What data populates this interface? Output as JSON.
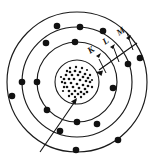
{
  "figure": {
    "type": "bohr-atom-model",
    "background_color": "#ffffff",
    "line_color": "#1a1a1a",
    "electron_color": "#111111",
    "nucleus": {
      "label": "nucleus",
      "center": [
        77,
        82
      ],
      "ring_radius": 22,
      "stipple_radius": 14,
      "nucleon_count": 46
    },
    "shells": [
      {
        "name": "K",
        "label": "K",
        "index": 1,
        "radius": 40,
        "electron_count": 5,
        "electrons": [
          [
            75,
            42
          ],
          [
            37,
            82
          ],
          [
            47,
            110
          ],
          [
            77,
            122
          ],
          [
            113,
            88
          ]
        ]
      },
      {
        "name": "L",
        "label": "L",
        "index": 2,
        "radius": 55,
        "electron_count": 6,
        "electrons": [
          [
            46,
            43
          ],
          [
            80,
            27
          ],
          [
            22,
            82
          ],
          [
            60,
            131
          ],
          [
            97,
            124
          ],
          [
            128,
            64
          ]
        ]
      },
      {
        "name": "M",
        "label": "M",
        "index": 3,
        "radius": 70,
        "electron_count": 6,
        "electrons": [
          [
            57,
            26
          ],
          [
            103,
            31
          ],
          [
            12,
            96
          ],
          [
            76,
            150
          ],
          [
            118,
            140
          ],
          [
            140,
            58
          ]
        ]
      }
    ],
    "annotations": [
      {
        "name": "nucleus-pointer",
        "kind": "arrow",
        "target": "nucleus",
        "from": [
          40,
          152
        ],
        "to": [
          74,
          99
        ]
      },
      {
        "name": "shell-callout-line",
        "kind": "arrow",
        "target": "K-shell",
        "from": [
          134,
          45
        ],
        "to": [
          95,
          73
        ]
      }
    ],
    "shell_labels": [
      {
        "text": "K",
        "x": 90,
        "y": 52,
        "rotation": -35
      },
      {
        "text": "L",
        "x": 105,
        "y": 43,
        "rotation": -35
      },
      {
        "text": "M",
        "x": 120,
        "y": 34,
        "rotation": -35
      }
    ]
  }
}
